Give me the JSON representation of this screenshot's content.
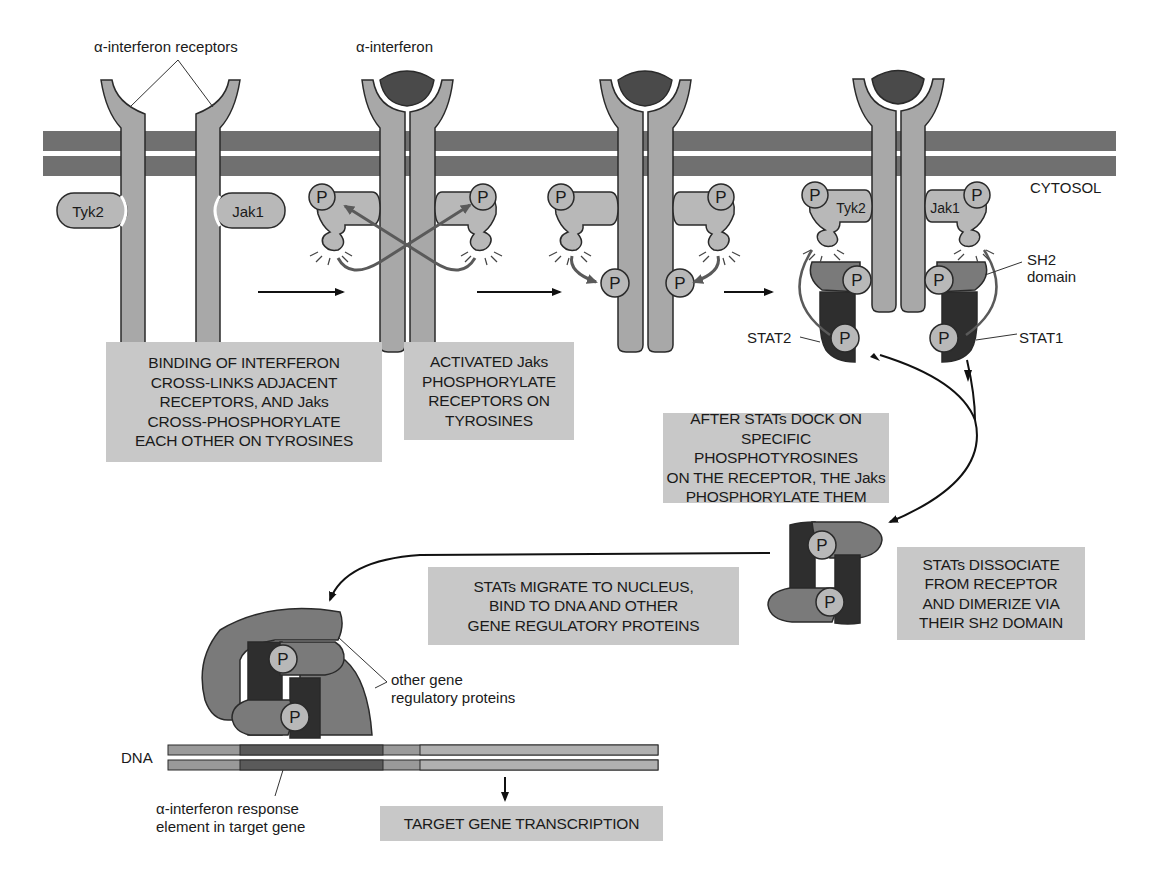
{
  "labels": {
    "receptors": "α-interferon receptors",
    "interferon": "α-interferon",
    "cytosol": "CYTOSOL",
    "tyk2": "Tyk2",
    "jak1": "Jak1",
    "sh2_line1": "SH2",
    "sh2_line2": "domain",
    "stat2": "STAT2",
    "stat1": "STAT1",
    "phospho": "P",
    "other_line1": "other gene",
    "other_line2": "regulatory proteins",
    "dna": "DNA",
    "response_line1": "α-interferon response",
    "response_line2": "element in target gene"
  },
  "steps": [
    {
      "lines": [
        "BINDING OF INTERFERON",
        "CROSS-LINKS ADJACENT",
        "RECEPTORS, AND Jaks",
        "CROSS-PHOSPHORYLATE",
        "EACH OTHER ON TYROSINES"
      ]
    },
    {
      "lines": [
        "ACTIVATED Jaks",
        "PHOSPHORYLATE",
        "RECEPTORS ON",
        "TYROSINES"
      ]
    },
    {
      "lines": [
        "AFTER STATs DOCK ON",
        "SPECIFIC PHOSPHOTYROSINES",
        "ON THE RECEPTOR, THE Jaks",
        "PHOSPHORYLATE THEM"
      ]
    },
    {
      "lines": [
        "STATs DISSOCIATE",
        "FROM RECEPTOR",
        "AND DIMERIZE VIA",
        "THEIR SH2 DOMAIN"
      ]
    },
    {
      "lines": [
        "STATs MIGRATE TO NUCLEUS,",
        "BIND TO DNA AND OTHER",
        "GENE REGULATORY PROTEINS"
      ]
    },
    {
      "lines": [
        "TARGET GENE TRANSCRIPTION"
      ]
    }
  ],
  "colors": {
    "membrane": "#6e6e6e",
    "receptor": "#a8a8a8",
    "interferon": "#4a4a4a",
    "jak": "#b8b8b8",
    "stat_dark": "#2e2e2e",
    "stat_mid": "#7a7a7a",
    "box": "#c8c8c8",
    "outline": "#2a2a2a"
  }
}
